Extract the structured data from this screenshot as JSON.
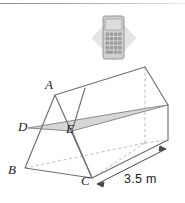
{
  "figure": {
    "type": "triangular-prism-diagram",
    "vertex_labels": [
      {
        "id": "A",
        "text": "A",
        "x": 45,
        "y": 78
      },
      {
        "id": "D",
        "text": "D",
        "x": 18,
        "y": 120
      },
      {
        "id": "E",
        "text": "E",
        "x": 66,
        "y": 122
      },
      {
        "id": "B",
        "text": "B",
        "x": 8,
        "y": 163
      },
      {
        "id": "C",
        "text": "C",
        "x": 81,
        "y": 174
      }
    ],
    "dimension": {
      "label": "3.5 m",
      "value": 3.5,
      "unit": "m",
      "x": 124,
      "y": 174
    },
    "colors": {
      "outline": "#6f6f6f",
      "hidden_edge": "#b0b0b0",
      "shaded_plane": "#d6d6d6",
      "shaded_plane_edge": "#8a8a8a",
      "label_text": "#1b1b1b",
      "top_rule": "#8d8d8d"
    }
  },
  "calculator_icon": {
    "name": "calculator-icon",
    "badge_shape": "diamond",
    "badge_color": "#e2e2e2",
    "body_color": "#c9c9c9",
    "screen_color": "#d8d8d8",
    "key_color": "#9d9d9d",
    "key_rows": 5,
    "key_cols": 4
  }
}
